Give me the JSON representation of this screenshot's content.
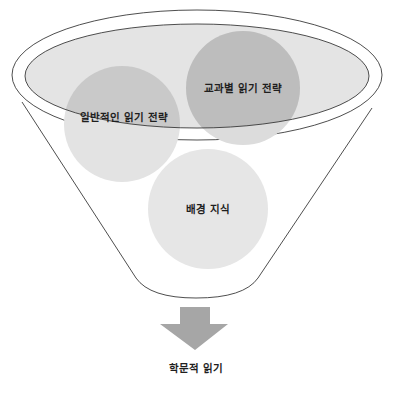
{
  "diagram": {
    "type": "funnel",
    "inputs": [
      {
        "label": "일반적인 읽기 전략",
        "fill": "#c9c9c9"
      },
      {
        "label": "교과별 읽기 전략",
        "fill": "#bdbdbd"
      },
      {
        "label": "배경 지식",
        "fill": "#e6e6e6"
      }
    ],
    "output": {
      "label": "학문적 읽기"
    },
    "colors": {
      "funnel_stroke": "#3a3a3a",
      "ellipse_fill": "#e4e4e4",
      "arrow_fill": "#a6a6a6",
      "text": "#1f1f1f"
    }
  }
}
